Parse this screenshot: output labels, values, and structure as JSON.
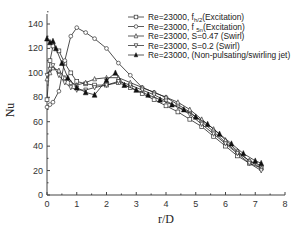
{
  "chart_data": {
    "type": "line",
    "title": "",
    "xlabel": "r/D",
    "ylabel": "Nu",
    "xlim": [
      0,
      8
    ],
    "ylim": [
      0,
      150
    ],
    "xticks": [
      0,
      1,
      2,
      3,
      4,
      5,
      6,
      7,
      8
    ],
    "yticks": [
      0,
      20,
      40,
      60,
      80,
      100,
      120,
      140
    ],
    "grid": false,
    "legend_position": "upper right",
    "series": [
      {
        "name": "Re=23000, f_{h/2}(Excitation)",
        "marker": "square-open",
        "x": [
          0,
          0.1,
          0.2,
          0.4,
          0.6,
          0.8,
          1.0,
          1.3,
          1.6,
          2.0,
          2.4,
          2.8,
          3.2,
          3.6,
          4.0,
          4.4,
          4.8,
          5.2,
          5.6,
          6.0,
          6.4,
          6.8,
          7.2
        ],
        "y": [
          78,
          110,
          122,
          118,
          108,
          100,
          93,
          91,
          90,
          90,
          92,
          88,
          83,
          78,
          73,
          68,
          62,
          56,
          48,
          40,
          32,
          26,
          22
        ]
      },
      {
        "name": "Re=23000, f_{5n}(Excitation)",
        "marker": "circle-open",
        "x": [
          0,
          0.1,
          0.2,
          0.4,
          0.6,
          0.8,
          1.0,
          1.3,
          1.6,
          2.0,
          2.4,
          2.8,
          3.2,
          3.6,
          4.0,
          4.4,
          4.8,
          5.2,
          5.6,
          6.0,
          6.4,
          6.8,
          7.2
        ],
        "y": [
          72,
          74,
          76,
          85,
          110,
          130,
          137,
          133,
          128,
          120,
          108,
          98,
          88,
          84,
          80,
          74,
          68,
          60,
          52,
          43,
          35,
          28,
          24
        ]
      },
      {
        "name": "Re=23000, S=0.47 (Swirl)",
        "marker": "triangle-up-open",
        "x": [
          0,
          0.1,
          0.2,
          0.4,
          0.6,
          0.8,
          1.0,
          1.3,
          1.6,
          2.0,
          2.4,
          2.8,
          3.2,
          3.6,
          4.0,
          4.4,
          4.8,
          5.2,
          5.6,
          6.0,
          6.4,
          6.8,
          7.2
        ],
        "y": [
          95,
          100,
          104,
          102,
          96,
          92,
          90,
          92,
          95,
          96,
          96,
          92,
          88,
          84,
          80,
          76,
          70,
          62,
          54,
          45,
          36,
          28,
          22
        ]
      },
      {
        "name": "Re=23000, S=0.2 (Swirl)",
        "marker": "triangle-down-open",
        "x": [
          0,
          0.1,
          0.2,
          0.4,
          0.6,
          0.8,
          1.0,
          1.3,
          1.6,
          2.0,
          2.4,
          2.8,
          3.2,
          3.6,
          4.0,
          4.4,
          4.8,
          5.2,
          5.6,
          6.0,
          6.4,
          6.8,
          7.2
        ],
        "y": [
          98,
          103,
          106,
          98,
          92,
          88,
          86,
          86,
          88,
          90,
          93,
          90,
          86,
          82,
          77,
          72,
          66,
          58,
          50,
          42,
          34,
          26,
          20
        ]
      },
      {
        "name": "Re=23000, (Non-pulsating/swirling jet)",
        "marker": "triangle-up-filled",
        "x": [
          0,
          0.1,
          0.2,
          0.3,
          0.5,
          0.7,
          1.0,
          1.3,
          1.6,
          2.0,
          2.3,
          2.6,
          3.0,
          3.4,
          3.8,
          4.2,
          4.6,
          5.0,
          5.4,
          5.8,
          6.2,
          6.6,
          7.0,
          7.2
        ],
        "y": [
          128,
          125,
          126,
          120,
          108,
          96,
          88,
          84,
          82,
          94,
          100,
          90,
          86,
          82,
          78,
          74,
          70,
          64,
          58,
          50,
          42,
          34,
          28,
          26
        ]
      }
    ]
  },
  "legend": {
    "items": [
      {
        "text": "Re=23000, f",
        "sub": "h/2",
        "tail": "(Excitation)",
        "marker": "square-open"
      },
      {
        "text": "Re=23000, f ",
        "sub": "5n",
        "tail": "(Excitation)",
        "marker": "circle-open"
      },
      {
        "text": "Re=23000, S=0.47 (Swirl)",
        "sub": "",
        "tail": "",
        "marker": "triangle-up-open"
      },
      {
        "text": "Re=23000, S=0.2 (Swirl)",
        "sub": "",
        "tail": "",
        "marker": "triangle-down-open"
      },
      {
        "text": "Re=23000, (Non-pulsating/swirling jet)",
        "sub": "",
        "tail": "",
        "marker": "triangle-up-filled"
      }
    ]
  },
  "axes": {
    "xlabel": "r/D",
    "ylabel": "Nu"
  }
}
